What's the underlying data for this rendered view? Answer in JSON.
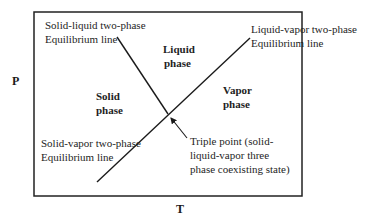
{
  "diagram": {
    "type": "phase-diagram",
    "axes": {
      "y_label": "P",
      "x_label": "T"
    },
    "regions": {
      "liquid": {
        "line1": "Liquid",
        "line2": "phase"
      },
      "solid": {
        "line1": "Solid",
        "line2": "phase"
      },
      "vapor": {
        "line1": "Vapor",
        "line2": "phase"
      }
    },
    "annotations": {
      "solid_liquid": {
        "line1": "Solid-liquid two-phase",
        "line2": "Equilibrium line"
      },
      "liquid_vapor": {
        "line1": "Liquid-vapor two-phase",
        "line2": "Equilibrium line"
      },
      "solid_vapor": {
        "line1": "Solid-vapor two-phase",
        "line2": "Equilibrium line"
      },
      "triple_point": {
        "line1": "Triple point (solid-",
        "line2": "liquid-vapor three",
        "line3": "phase coexisting state)"
      }
    },
    "colors": {
      "line": "#1a1a1a",
      "frame": "#222222",
      "background": "#ffffff"
    }
  }
}
